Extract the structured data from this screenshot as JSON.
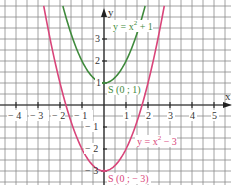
{
  "chart_data": {
    "type": "line",
    "title": "",
    "xlabel": "x",
    "ylabel": "y",
    "xlim": [
      -4.7,
      5.8
    ],
    "ylim": [
      -3.6,
      4.5
    ],
    "grid": true,
    "grid_step": 0.5,
    "x_ticks": [
      -4,
      -3,
      -2,
      -1,
      1,
      2,
      3,
      4,
      5
    ],
    "x_tick_labels": [
      "− 4",
      "− 3",
      "− 2",
      "− 1",
      "1",
      "2",
      "3",
      "4",
      "5"
    ],
    "y_ticks": [
      3,
      2,
      1,
      -1,
      -2,
      -3
    ],
    "y_tick_labels": [
      "3",
      "2",
      "1",
      "− 1",
      "− 2",
      "− 3"
    ],
    "series": [
      {
        "name": "y = x² + 1",
        "function": "x^2 + 1",
        "color": "#3f8a3c",
        "vertex": [
          0,
          1
        ],
        "vertex_label": "S (0 ; 1)",
        "x_range": [
          -1.87,
          1.87
        ]
      },
      {
        "name": "y = x² − 3",
        "function": "x^2 - 3",
        "color": "#d9457a",
        "vertex": [
          0,
          -3
        ],
        "vertex_label": "S (0 ; − 3)",
        "x_range": [
          -2.74,
          2.74
        ]
      }
    ]
  },
  "labels": {
    "x_axis": "x",
    "y_axis": "y",
    "eq_green_prefix": "y = x",
    "eq_green_exp": "2",
    "eq_green_suffix": " + 1",
    "eq_pink_prefix": "y = x",
    "eq_pink_exp": "2",
    "eq_pink_suffix": " − 3",
    "vertex_green": "S (0 ; 1)",
    "vertex_pink": "S (0 ; − 3)"
  },
  "ticks": {
    "xm4": "− 4",
    "xm3": "− 3",
    "xm2": "− 2",
    "xm1": "− 1",
    "x1": "1",
    "x2": "2",
    "x3": "3",
    "x4": "4",
    "x5": "5",
    "y3": "3",
    "y2": "2",
    "y1": "1",
    "ym1": "− 1",
    "ym2": "− 2",
    "ym3": "− 3"
  },
  "colors": {
    "green": "#3f8a3c",
    "pink": "#d9457a",
    "grid": "#8a8a8a",
    "axis": "#222222"
  }
}
